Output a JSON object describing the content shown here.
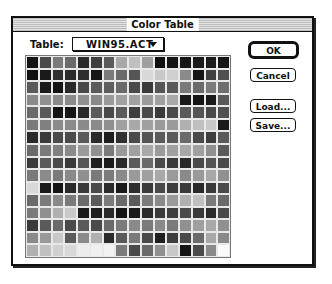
{
  "window": {
    "title": "Color Table"
  },
  "table": {
    "label": "Table:",
    "selected": "WIN95.ACT"
  },
  "buttons": {
    "ok": "OK",
    "cancel": "Cancel",
    "load": "Load...",
    "save": "Save..."
  },
  "icons": {
    "dropdown": "chevron-down-icon"
  },
  "swatches": {
    "columns": 16,
    "rows": 16,
    "grays": [
      [
        "#151515",
        "#4a4a4a",
        "#7a7a7a",
        "#6a6a6a",
        "#2a2a2a",
        "#3e3e3e",
        "#5a5a5a",
        "#a8a8a8",
        "#c0c0c0",
        "#a0a0a0",
        "#101010",
        "#151515",
        "#151515",
        "#1a1a1a",
        "#1a1a1a",
        "#151515"
      ],
      [
        "#101010",
        "#1a1a1a",
        "#303030",
        "#2a2a2a",
        "#2e2e2e",
        "#151515",
        "#7a7a7a",
        "#6a6a6a",
        "#555555",
        "#d8d8d8",
        "#c8c8c8",
        "#d0d0d0",
        "#8a8a8a",
        "#151515",
        "#404040",
        "#505050"
      ],
      [
        "#5a5a5a",
        "#1a1a1a",
        "#151515",
        "#2a2a2a",
        "#4a4a4a",
        "#5a5a5a",
        "#5e5e5e",
        "#6a6a6a",
        "#4a4a4a",
        "#3a3a3a",
        "#555555",
        "#5a5a5a",
        "#7a7a7a",
        "#6a6a6a",
        "#7a7a7a",
        "#6e6e6e"
      ],
      [
        "#8a8a8a",
        "#909090",
        "#8a8a8a",
        "#8a8a8a",
        "#909090",
        "#8a8a8a",
        "#9a9a9a",
        "#a0a0a0",
        "#a0a0a0",
        "#9a9a9a",
        "#a0a0a0",
        "#a8a8a8",
        "#1a1a1a",
        "#151515",
        "#1a1a1a",
        "#5a5a5a"
      ],
      [
        "#6a6a6a",
        "#5a5a5a",
        "#151515",
        "#151515",
        "#2a2a2a",
        "#5a5a5a",
        "#4a4a4a",
        "#5a5a5a",
        "#3e3e3e",
        "#4a4a4a",
        "#3a3a3a",
        "#4a4a4a",
        "#5a5a5a",
        "#555555",
        "#4a4a4a",
        "#505050"
      ],
      [
        "#7a7a7a",
        "#808080",
        "#8a8a8a",
        "#8a8a8a",
        "#8a8a8a",
        "#8a8a8a",
        "#909090",
        "#a0a0a0",
        "#a8a8a8",
        "#a0a0a0",
        "#9a9a9a",
        "#9a9a9a",
        "#b0b0b0",
        "#c0c0c0",
        "#c8c8c8",
        "#1a1a1a"
      ],
      [
        "#2a2a2a",
        "#3a3a3a",
        "#4a4a4a",
        "#4a4a4a",
        "#5a5a5a",
        "#2a2a2a",
        "#1e1e1e",
        "#303030",
        "#4a4a4a",
        "#555555",
        "#5a5a5a",
        "#5a5a5a",
        "#6a6a6a",
        "#4a4a4a",
        "#3e3e3e",
        "#5a5a5a"
      ],
      [
        "#6a6a6a",
        "#7a7a7a",
        "#808080",
        "#8a8a8a",
        "#9a9a9a",
        "#909090",
        "#7a7a7a",
        "#9a9a9a",
        "#a0a0a0",
        "#a8a8a8",
        "#9a9a9a",
        "#a0a0a0",
        "#a8a8a8",
        "#a0a0a0",
        "#909090",
        "#5a5a5a"
      ],
      [
        "#3a3a3a",
        "#5a5a5a",
        "#4a4a4a",
        "#3a3a3a",
        "#555555",
        "#1e1e1e",
        "#1a1a1a",
        "#2a2a2a",
        "#5a5a5a",
        "#6a6a6a",
        "#4a4a4a",
        "#3a3a3a",
        "#2a2a2a",
        "#4a4a4a",
        "#555555",
        "#4a4a4a"
      ],
      [
        "#7a7a7a",
        "#8a8a8a",
        "#7a7a7a",
        "#8a8a8a",
        "#909090",
        "#7a7a7a",
        "#7a7a7a",
        "#8a8a8a",
        "#9a9a9a",
        "#a0a0a0",
        "#a8a8a8",
        "#9a9a9a",
        "#8a8a8a",
        "#9a9a9a",
        "#a8a8a8",
        "#909090"
      ],
      [
        "#d8d8d8",
        "#1a1a1a",
        "#151515",
        "#2a2a2a",
        "#3a3a3a",
        "#4a4a4a",
        "#2a2a2a",
        "#1a1a1a",
        "#2e2e2e",
        "#3a3a3a",
        "#4a4a4a",
        "#3e3e3e",
        "#3a3a3a",
        "#2a2a2a",
        "#3a3a3a",
        "#4a4a4a"
      ],
      [
        "#6a6a6a",
        "#7a7a7a",
        "#8a8a8a",
        "#7a7a7a",
        "#6a6a6a",
        "#5a5a5a",
        "#7a7a7a",
        "#6a6a6a",
        "#5a5a5a",
        "#7a7a7a",
        "#8a8a8a",
        "#9a9a9a",
        "#b0b0b0",
        "#c0c0c0",
        "#7a7a7a",
        "#6a6a6a"
      ],
      [
        "#7a7a7a",
        "#909090",
        "#b0b0b0",
        "#c8c8c8",
        "#1a1a1a",
        "#1e1e1e",
        "#2a2a2a",
        "#151515",
        "#1a1a1a",
        "#2a2a2a",
        "#3a3a3a",
        "#3e3e3e",
        "#4a4a4a",
        "#3a3a3a",
        "#2a2a2a",
        "#4a4a4a"
      ],
      [
        "#3a3a3a",
        "#5a5a5a",
        "#6a6a6a",
        "#4a4a4a",
        "#5a5a5a",
        "#4a4a4a",
        "#6a6a6a",
        "#7a7a7a",
        "#8a8a8a",
        "#7a7a7a",
        "#8a8a8a",
        "#7a7a7a",
        "#909090",
        "#a0a0a0",
        "#a8a8a8",
        "#909090"
      ],
      [
        "#8a8a8a",
        "#9a9a9a",
        "#c8c8c8",
        "#5a5a5a",
        "#8a8a8a",
        "#b0b0b0",
        "#2a2a2a",
        "#5a5a5a",
        "#7a7a7a",
        "#4a4a4a",
        "#1e1e1e",
        "#3e3e3e",
        "#4a4a4a",
        "#6a6a6a",
        "#a8a8a8",
        "#8a8a8a"
      ],
      [
        "#b0b0b0",
        "#c0c0c0",
        "#d0d0d0",
        "#d8d8d8",
        "#ececec",
        "#f0f0f0",
        "#f2f2f2",
        "#7a7a7a",
        "#4a4a4a",
        "#6a6a6a",
        "#909090",
        "#c8c8c8",
        "#151515",
        "#4a4a4a",
        "#8a8a8a",
        "#fafafa"
      ]
    ]
  }
}
